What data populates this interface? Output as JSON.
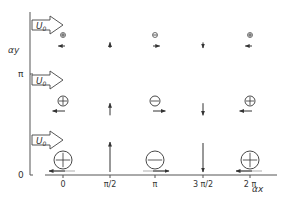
{
  "diagram": {
    "axes": {
      "x_label": "αx",
      "y_label": "αy",
      "y_ticks": [
        {
          "label": "π",
          "y": 74
        },
        {
          "label": "0",
          "y": 175
        }
      ],
      "x_ticks": [
        {
          "label": "0",
          "x": 63
        },
        {
          "label": "π/2",
          "x": 110
        },
        {
          "label": "π",
          "x": 155
        },
        {
          "label": "3 π/2",
          "x": 203
        },
        {
          "label": "2 π",
          "x": 250
        }
      ]
    },
    "flow_arrows": [
      {
        "label": "U₀",
        "label_main": "U",
        "label_sub": "0",
        "y": 25
      },
      {
        "label": "U₀",
        "label_main": "U",
        "label_sub": "0",
        "y": 80
      },
      {
        "label": "U₀",
        "label_main": "U",
        "label_sub": "0",
        "y": 140
      }
    ],
    "rows": [
      {
        "level": "top",
        "symbol_y": 35,
        "arrow_y": 46,
        "radius": 2.5,
        "vec_len": 6,
        "cells": [
          {
            "x": 63,
            "symbol": "plus",
            "vector": "left"
          },
          {
            "x": 110,
            "symbol": null,
            "vector": "up"
          },
          {
            "x": 155,
            "symbol": "minus",
            "vector": "right"
          },
          {
            "x": 203,
            "symbol": null,
            "vector": "down"
          },
          {
            "x": 250,
            "symbol": "plus",
            "vector": "left"
          }
        ]
      },
      {
        "level": "middle",
        "symbol_y": 101,
        "arrow_y": 111,
        "radius": 5,
        "vec_len": 13,
        "cells": [
          {
            "x": 63,
            "symbol": "plus",
            "vector": "left"
          },
          {
            "x": 110,
            "symbol": null,
            "vector": "up"
          },
          {
            "x": 155,
            "symbol": "minus",
            "vector": "right"
          },
          {
            "x": 203,
            "symbol": null,
            "vector": "down"
          },
          {
            "x": 250,
            "symbol": "plus",
            "vector": "left"
          }
        ]
      },
      {
        "level": "bottom",
        "symbol_y": 160,
        "arrow_y": 171,
        "radius": 9,
        "vec_len": 28,
        "cells": [
          {
            "x": 63,
            "symbol": "plus",
            "vector": "left"
          },
          {
            "x": 110,
            "symbol": null,
            "vector": "up"
          },
          {
            "x": 155,
            "symbol": "minus",
            "vector": "right"
          },
          {
            "x": 203,
            "symbol": null,
            "vector": "down"
          },
          {
            "x": 250,
            "symbol": "plus",
            "vector": "left"
          }
        ]
      }
    ],
    "colors": {
      "ink": "#333333",
      "axis": "#555555",
      "background": "#ffffff"
    }
  }
}
